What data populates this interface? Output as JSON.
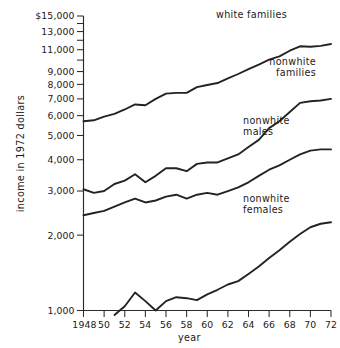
{
  "chart_data": {
    "type": "line",
    "title": "",
    "xlabel": "year",
    "ylabel": "income in 1972 dollars",
    "yscale": "log",
    "ylim": [
      1000,
      15000
    ],
    "xlim": [
      1948,
      1972
    ],
    "grid": false,
    "legend_position": "inline-right-of-series",
    "ytick_labels": [
      "$15,000",
      "13,000",
      "11,000",
      "9,000",
      "8,000",
      "7,000",
      "6,000",
      "5,000",
      "4,000",
      "3,000",
      "2,000",
      "1,000"
    ],
    "ytick_values": [
      15000,
      13000,
      11000,
      9000,
      8000,
      7000,
      6000,
      5000,
      4000,
      3000,
      2000,
      1000
    ],
    "yminor_ticks": [
      14000,
      12000,
      10000
    ],
    "xtick_labels": [
      "1948",
      "50",
      "52",
      "54",
      "56",
      "58",
      "60",
      "62",
      "64",
      "66",
      "68",
      "70",
      "72"
    ],
    "xtick_values": [
      1948,
      1950,
      1952,
      1954,
      1956,
      1958,
      1960,
      1962,
      1964,
      1966,
      1968,
      1970,
      1972
    ],
    "x": [
      1948,
      1949,
      1950,
      1951,
      1952,
      1953,
      1954,
      1955,
      1956,
      1957,
      1958,
      1959,
      1960,
      1961,
      1962,
      1963,
      1964,
      1965,
      1966,
      1967,
      1968,
      1969,
      1970,
      1971,
      1972
    ],
    "series": [
      {
        "name": "white families",
        "label": "white families",
        "label_lines": [
          "white  families"
        ],
        "color": "#232323",
        "values": [
          5700,
          5750,
          5950,
          6100,
          6350,
          6650,
          6600,
          7000,
          7350,
          7400,
          7400,
          7800,
          7950,
          8100,
          8450,
          8800,
          9200,
          9600,
          10050,
          10350,
          10900,
          11350,
          11300,
          11400,
          11600
        ]
      },
      {
        "name": "nonwhite families",
        "label": "nonwhite families",
        "label_lines": [
          "nonwhite",
          "families"
        ],
        "color": "#232323",
        "values": [
          3050,
          2950,
          3000,
          3200,
          3300,
          3500,
          3250,
          3450,
          3700,
          3700,
          3600,
          3850,
          3900,
          3900,
          4050,
          4200,
          4500,
          4800,
          5350,
          5700,
          6200,
          6750,
          6850,
          6900,
          7000
        ]
      },
      {
        "name": "nonwhite males",
        "label": "nonwhite males",
        "label_lines": [
          "nonwhite",
          "males"
        ],
        "color": "#232323",
        "values": [
          2400,
          2450,
          2500,
          2600,
          2700,
          2800,
          2700,
          2750,
          2850,
          2900,
          2800,
          2900,
          2950,
          2900,
          3000,
          3100,
          3250,
          3450,
          3650,
          3800,
          4000,
          4200,
          4350,
          4400,
          4400
        ]
      },
      {
        "name": "nonwhite females",
        "label": "nonwhite females",
        "label_lines": [
          "nonwhite",
          "females"
        ],
        "color": "#232323",
        "values": [
          null,
          null,
          null,
          960,
          1040,
          1180,
          1090,
          1000,
          1090,
          1130,
          1120,
          1100,
          1160,
          1210,
          1270,
          1310,
          1400,
          1500,
          1620,
          1740,
          1880,
          2020,
          2150,
          2220,
          2250
        ]
      }
    ]
  },
  "labels": {
    "white_families": "white  families",
    "nonwhite_families_l1": "nonwhite",
    "nonwhite_families_l2": "families",
    "nonwhite_males_l1": "nonwhite",
    "nonwhite_males_l2": "males",
    "nonwhite_females_l1": "nonwhite",
    "nonwhite_females_l2": "females",
    "y_axis_title": "income in 1972 dollars",
    "x_axis_title": "year"
  },
  "yticks": {
    "t15000": "$15,000",
    "t13000": "13,000",
    "t11000": "11,000",
    "t9000": "9,000",
    "t8000": "8,000",
    "t7000": "7,000",
    "t6000": "6,000",
    "t5000": "5,000",
    "t4000": "4,000",
    "t3000": "3,000",
    "t2000": "2,000",
    "t1000": "1,000"
  },
  "xticks": {
    "x1948": "1948",
    "x1950": "50",
    "x1952": "52",
    "x1954": "54",
    "x1956": "56",
    "x1958": "58",
    "x1960": "60",
    "x1962": "62",
    "x1964": "64",
    "x1966": "66",
    "x1968": "68",
    "x1970": "70",
    "x1972": "72"
  },
  "colors": {
    "line": "#232323",
    "axis": "#2b2b2b",
    "background": "#ffffff"
  }
}
